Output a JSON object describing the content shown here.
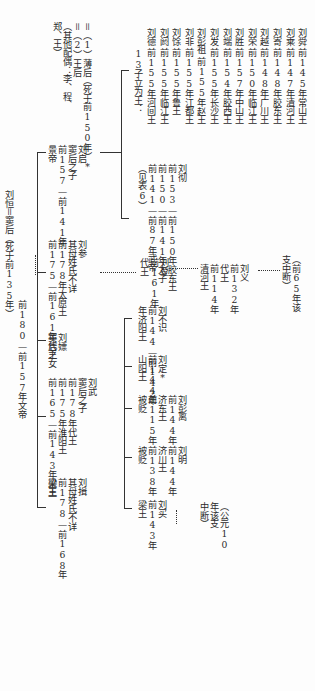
{
  "root": {
    "line1": "刘恒＝窦后（死于前135年）",
    "line2": "前180—前157年文帝"
  },
  "children": [
    {
      "id": "liuqi",
      "lines": [
        "刘启",
        "窦后之子",
        "前157—前141年",
        "景帝"
      ]
    },
    {
      "id": "liucan",
      "lines": [
        "刘参",
        "其母姓氏不详",
        "前178年太原王",
        "前175—前161年代王"
      ]
    },
    {
      "id": "liupiao",
      "lines": [
        "刘嫖",
        "窦后之女"
      ]
    },
    {
      "id": "liuwu",
      "lines": [
        "刘武",
        "窦后之子",
        "前178年代王",
        "前175年淮阳王",
        "前165—前143年梁王"
      ]
    },
    {
      "id": "liuyi",
      "lines": [
        "刘揖",
        "其母姓氏不详",
        "前178—前168年",
        "梁王"
      ]
    }
  ],
  "liuqi_spouses": {
    "lines": [
      "＝（1）薄后（死于前150年）*",
      "＝（2）王后",
      "（其他配偶：李、程、",
      "郑、王）"
    ]
  },
  "liuche": {
    "lines": [
      "刘彻",
      "前153—前150年胶东王",
      "前150—前141年太子",
      "前141—前87年武帝",
      "（见表6）"
    ]
  },
  "thirteen_sons": {
    "heading": "13子立为王：",
    "items": [
      {
        "name": "刘德",
        "title": "前155年河间王"
      },
      {
        "name": "刘阏",
        "title": "前155年临江王"
      },
      {
        "name": "刘馀",
        "title": "前155年鲁王"
      },
      {
        "name": "刘非",
        "title": "前155年江都王"
      },
      {
        "name": "刘彭祖",
        "title": "前155年赵王"
      },
      {
        "name": "刘发",
        "title": "前155年长沙王"
      },
      {
        "name": "刘端",
        "title": "前154年胶西王"
      },
      {
        "name": "刘胜",
        "title": "前157年中山王"
      },
      {
        "name": "刘荣",
        "title": "前150年临江王"
      },
      {
        "name": "刘越",
        "title": "前148年广川王"
      },
      {
        "name": "刘寄",
        "title": "前148年胶东王"
      },
      {
        "name": "刘乘",
        "title": "前147年清河王"
      },
      {
        "name": "刘舜",
        "title": "前145年常山王"
      }
    ]
  },
  "liucan_line": [
    {
      "lines": [
        "刘登",
        "前161年",
        "代王"
      ]
    },
    {
      "lines": [
        "刘义",
        "前132年",
        "代王",
        "前114年",
        "清河王"
      ]
    },
    {
      "lines": [
        "（前65年该",
        "支中断）"
      ]
    }
  ],
  "liuwu_sons": [
    {
      "lines": [
        "刘不识",
        "前144—前142",
        "年济阳王"
      ]
    },
    {
      "lines": [
        "刘定*",
        "前144年",
        "山阳王"
      ]
    },
    {
      "lines": [
        "刘彭离",
        "前144年",
        "济东王",
        "前115年",
        "被贬"
      ]
    },
    {
      "lines": [
        "刘明",
        "前144年",
        "济川王",
        "前138年",
        "被贬"
      ]
    },
    {
      "lines": [
        "刘买",
        "前143年",
        "梁王"
      ]
    }
  ],
  "liumai_note": {
    "lines": [
      "（公元10",
      "年该支",
      "中断）"
    ]
  }
}
